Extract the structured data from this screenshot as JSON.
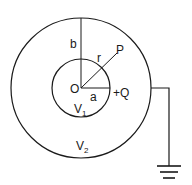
{
  "diagram": {
    "labels": {
      "b": "b",
      "r": "r",
      "P": "P",
      "O": "O",
      "a": "a",
      "charge": "+Q",
      "V1_main": "V",
      "V1_sub": "1",
      "V2_main": "V",
      "V2_sub": "2"
    },
    "elements": {
      "outer_sphere": "outer conducting shell, radius b, potential V2",
      "inner_sphere": "inner sphere, radius a, charge +Q, potential V1",
      "ground": "ground-symbol"
    },
    "colors": {
      "stroke": "#1a1a1a",
      "background": "#ffffff"
    }
  }
}
